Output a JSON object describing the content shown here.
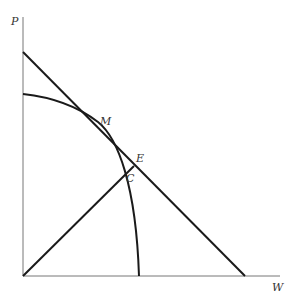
{
  "diagram": {
    "axes": {
      "y_label": "P",
      "x_label": "W"
    },
    "points": {
      "M": "M",
      "E": "E",
      "C": "C"
    },
    "elements": [
      "vertical axis P",
      "horizontal axis W",
      "straight tangent line from P-axis to W-axis",
      "concave frontier curve from P-axis to W-axis, tangent to line at M",
      "ray from origin through C to E"
    ],
    "colors": {
      "line": "#1a1a1a",
      "axis": "#666666"
    }
  }
}
